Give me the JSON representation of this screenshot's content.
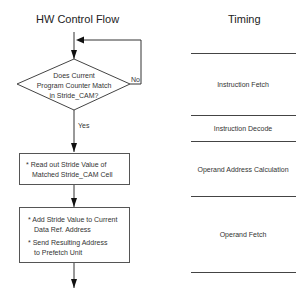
{
  "flow": {
    "title": "HW Control Flow",
    "decision": {
      "lines": [
        "Does Current",
        "Program Counter Match",
        "in Stride_CAM?"
      ],
      "no_label": "No",
      "yes_label": "Yes"
    },
    "box1": {
      "items": [
        "* Read out Stride Value of",
        "Matched Stride_CAM Cell"
      ]
    },
    "box2": {
      "items": [
        "* Add Stride Value to Current",
        "Data Ref. Address",
        "* Send Resulting Address",
        "to Prefetch Unit"
      ]
    }
  },
  "timing": {
    "title": "Timing",
    "stages": [
      {
        "label": "Instruction Fetch"
      },
      {
        "label": "Instruction Decode"
      },
      {
        "label": "Operand Address Calculation"
      },
      {
        "label": "Operand Fetch"
      }
    ]
  },
  "colors": {
    "line": "#444444",
    "text": "#333333",
    "background": "#ffffff"
  }
}
